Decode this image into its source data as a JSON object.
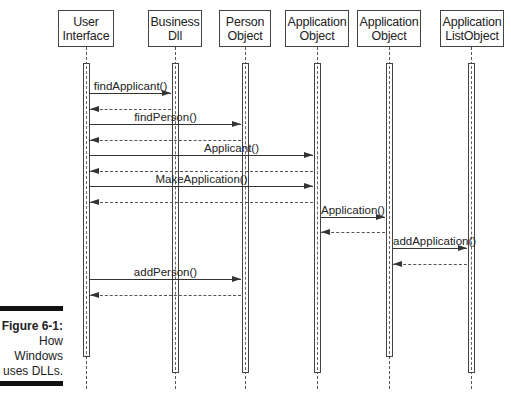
{
  "figure": {
    "caption_title": "Figure 6-1:",
    "caption_lines": [
      "How",
      "Windows",
      "uses DLLs."
    ]
  },
  "objects": [
    {
      "line1": "User",
      "line2": "Interface"
    },
    {
      "line1": "Business",
      "line2": "Dll"
    },
    {
      "line1": "Person",
      "line2": "Object"
    },
    {
      "line1": "Application",
      "line2": "Object"
    },
    {
      "line1": "Application",
      "line2": "Object"
    },
    {
      "line1": "Application",
      "line2": "ListObject"
    }
  ],
  "messages": [
    {
      "label": "findApplicant()",
      "from": "User Interface",
      "to": "Business Dll"
    },
    {
      "label": "findPerson()",
      "from": "User Interface",
      "to": "Person Object"
    },
    {
      "label": "Applicant()",
      "from": "User Interface",
      "to": "Application Object"
    },
    {
      "label": "MakeApplication()",
      "from": "User Interface",
      "to": "Application Object"
    },
    {
      "label": "Application()",
      "from": "Application Object",
      "to": "Application Object (2)"
    },
    {
      "label": "addApplication()",
      "from": "Application Object (2)",
      "to": "Application ListObject"
    },
    {
      "label": "addPerson()",
      "from": "User Interface",
      "to": "Person Object"
    }
  ]
}
